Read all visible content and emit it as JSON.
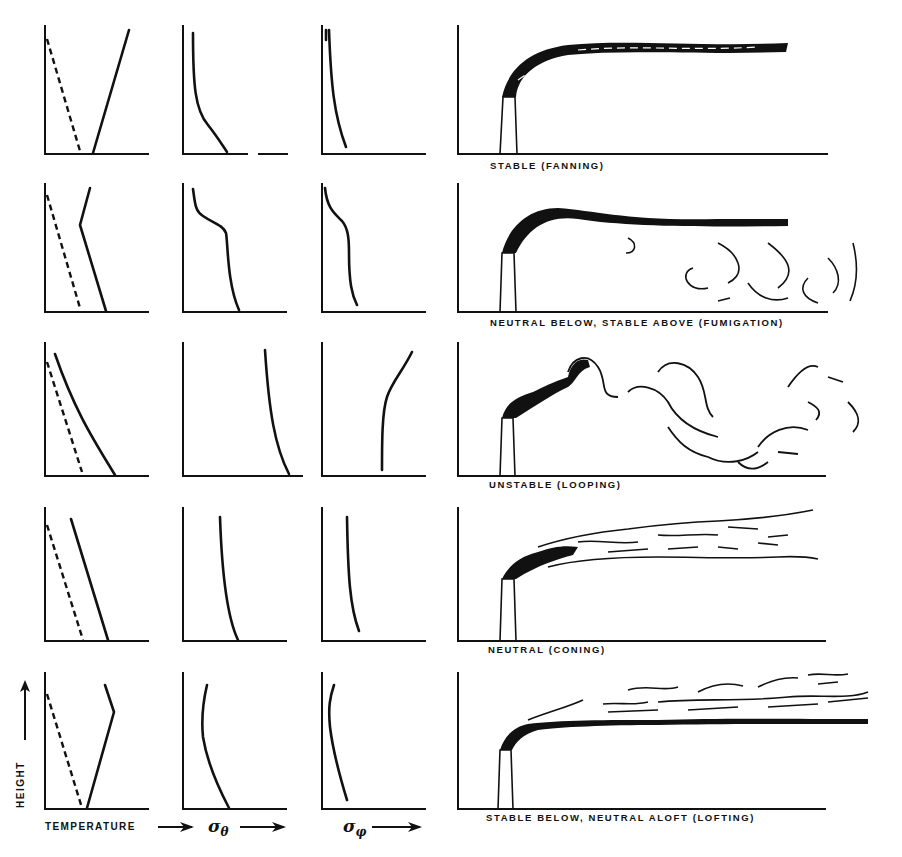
{
  "figure": {
    "axis_labels": {
      "height": "HEIGHT",
      "temperature": "TEMPERATURE",
      "sigma_theta": "σθ",
      "sigma_phi": "σφ"
    },
    "rows": [
      {
        "label": "STABLE (FANNING)",
        "condition": "stable",
        "plume_type": "fanning"
      },
      {
        "label": "NEUTRAL BELOW, STABLE ABOVE (FUMIGATION)",
        "condition": "neutral-below-stable-above",
        "plume_type": "fumigation"
      },
      {
        "label": "UNSTABLE (LOOPING)",
        "condition": "unstable",
        "plume_type": "looping"
      },
      {
        "label": "NEUTRAL (CONING)",
        "condition": "neutral",
        "plume_type": "coning"
      },
      {
        "label": "STABLE BELOW, NEUTRAL ALOFT (LOFTING)",
        "condition": "stable-below-neutral-aloft",
        "plume_type": "lofting"
      }
    ],
    "legend": {
      "dashed_line": "dry adiabatic lapse rate",
      "solid_line": "actual temperature profile"
    }
  },
  "colors": {
    "ink": "#111111",
    "background": "#ffffff"
  }
}
